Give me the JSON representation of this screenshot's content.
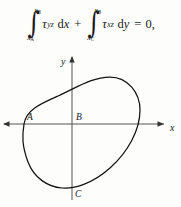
{
  "equation": {
    "integral_1": {
      "upper_limit_var": "x",
      "upper_limit_sub": "B",
      "lower_limit_var": "x",
      "lower_limit_sub": "A",
      "integrand_symbol": "τ",
      "integrand_sub": "yz",
      "differential_d": "d",
      "differential_var": "x"
    },
    "operator": "+",
    "integral_2": {
      "upper_limit_var": "x",
      "upper_limit_sub": "B",
      "lower_limit_var": "x",
      "lower_limit_sub": "C",
      "integrand_symbol": "τ",
      "integrand_sub": "xz",
      "differential_d": "d",
      "differential_var": "y"
    },
    "equals": "=",
    "right_hand_side": "0,"
  },
  "diagram": {
    "axis_x_label": "x",
    "axis_y_label": "y",
    "point_labels": {
      "a": "A",
      "b": "B",
      "c": "C"
    },
    "colors": {
      "ink": "#1a1a1a",
      "axis": "#4a4a4a",
      "curve": "#111111",
      "background": "#fdfdfc"
    }
  }
}
